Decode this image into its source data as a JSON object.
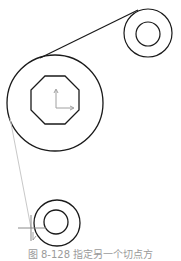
{
  "drawing": {
    "stroke_color": "#1a1a1a",
    "rubber_band_color": "#c8c8c8",
    "ucs_color": "#a0a0a0",
    "large_pulley": {
      "cx": 55,
      "cy": 103,
      "r": 48
    },
    "octagon": {
      "cx": 55,
      "cy": 100,
      "r": 26
    },
    "ucs_icon": {
      "x": 56,
      "y": 108,
      "len": 18
    },
    "small_pulley_top": {
      "cx": 148,
      "cy": 33,
      "r_outer": 24,
      "r_inner": 12
    },
    "small_pulley_bottom": {
      "cx": 57,
      "cy": 223,
      "r_outer": 23,
      "r_inner": 12
    },
    "tangent_line": {
      "x1": 40,
      "y1": 58,
      "x2": 138,
      "y2": 10
    },
    "rubber_band_line": {
      "x1": 10,
      "y1": 118,
      "x2": 31,
      "y2": 228
    },
    "cursor": {
      "x": 31,
      "y": 228
    }
  },
  "caption": "图 8-128  指定另一个切点方"
}
